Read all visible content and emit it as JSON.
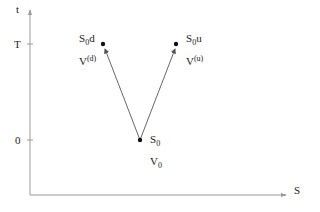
{
  "axes": {
    "y_label": "t",
    "x_label": "S",
    "ticks": [
      {
        "label": "T"
      },
      {
        "label": "0"
      }
    ]
  },
  "nodes": {
    "origin": {
      "main": "S",
      "main_sub": "0",
      "value": "V",
      "value_sub": "0"
    },
    "down": {
      "main": "S",
      "main_sub": "0",
      "main_suffix": "d",
      "value": "V",
      "value_sup": "(d)"
    },
    "up": {
      "main": "S",
      "main_sub": "0",
      "main_suffix": "u",
      "value": "V",
      "value_sup": "(u)"
    }
  },
  "colors": {
    "axis": "#9a9a9a",
    "arrow": "#555555",
    "node": "#111111",
    "text": "#222222"
  }
}
